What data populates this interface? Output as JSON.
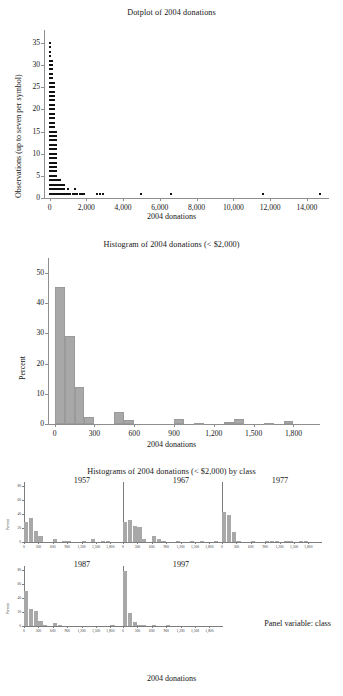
{
  "figure": {
    "caption_font": "serif",
    "background": "#ffffff",
    "bar_color": "#a8a8a8",
    "dot_color": "#111111",
    "axis_color": "#8e8e8e"
  },
  "chart_data": [
    {
      "id": "dotplot",
      "type": "scatter",
      "title": "Dotplot of 2004 donations",
      "xlabel": "2004 donations",
      "ylabel": "Observations (up to seven per symbol)",
      "xlim": [
        -300,
        15200
      ],
      "ylim": [
        0,
        37
      ],
      "xticks": [
        0,
        2000,
        4000,
        6000,
        8000,
        10000,
        12000,
        14000
      ],
      "xticklabels": [
        "0",
        "2,000",
        "4,000",
        "6,000",
        "8,000",
        "10,000",
        "12,000",
        "14,000"
      ],
      "yticks": [
        0,
        5,
        10,
        15,
        20,
        25,
        30,
        35
      ],
      "yticklabels": [
        "0",
        "5",
        "10",
        "15",
        "20",
        "25",
        "30",
        "35"
      ],
      "grid": false,
      "note": "Each column is a donation bin; stack height = number of observations (up to seven donors per plotted symbol).",
      "columns": [
        {
          "x": 40,
          "count": 35
        },
        {
          "x": 150,
          "count": 31
        },
        {
          "x": 260,
          "count": 26
        },
        {
          "x": 370,
          "count": 15
        },
        {
          "x": 480,
          "count": 4
        },
        {
          "x": 590,
          "count": 4
        },
        {
          "x": 700,
          "count": 3
        },
        {
          "x": 810,
          "count": 3
        },
        {
          "x": 920,
          "count": 1
        },
        {
          "x": 1030,
          "count": 2
        },
        {
          "x": 1140,
          "count": 1
        },
        {
          "x": 1250,
          "count": 1
        },
        {
          "x": 1400,
          "count": 2
        },
        {
          "x": 1520,
          "count": 1
        },
        {
          "x": 1640,
          "count": 1
        },
        {
          "x": 1760,
          "count": 1
        },
        {
          "x": 1880,
          "count": 1
        },
        {
          "x": 2600,
          "count": 1
        },
        {
          "x": 2750,
          "count": 1
        },
        {
          "x": 2900,
          "count": 1
        },
        {
          "x": 5000,
          "count": 1
        },
        {
          "x": 6600,
          "count": 1
        },
        {
          "x": 11600,
          "count": 1
        },
        {
          "x": 14700,
          "count": 1
        }
      ]
    },
    {
      "id": "histogram",
      "type": "bar",
      "title": "Histogram of 2004 donations (< $2,000)",
      "xlabel": "2004 donations",
      "ylabel": "Percent",
      "xlim": [
        -50,
        2000
      ],
      "ylim": [
        0,
        53
      ],
      "xticks": [
        0,
        300,
        600,
        900,
        1200,
        1500,
        1800
      ],
      "xticklabels": [
        "0",
        "300",
        "600",
        "900",
        "1,200",
        "1,500",
        "1,800"
      ],
      "yticks": [
        0,
        10,
        20,
        30,
        40,
        50
      ],
      "yticklabels": [
        "0",
        "10",
        "20",
        "30",
        "40",
        "50"
      ],
      "binwidth": 75,
      "grid": false,
      "bins": [
        {
          "left": 0,
          "value": 45.4
        },
        {
          "left": 75,
          "value": 29.0
        },
        {
          "left": 150,
          "value": 12.2
        },
        {
          "left": 225,
          "value": 2.3
        },
        {
          "left": 300,
          "value": 0.0
        },
        {
          "left": 375,
          "value": 0.0
        },
        {
          "left": 450,
          "value": 3.9
        },
        {
          "left": 525,
          "value": 1.2
        },
        {
          "left": 600,
          "value": 0.0
        },
        {
          "left": 675,
          "value": 0.0
        },
        {
          "left": 750,
          "value": 0.0
        },
        {
          "left": 825,
          "value": 0.0
        },
        {
          "left": 900,
          "value": 1.7
        },
        {
          "left": 975,
          "value": 0.0
        },
        {
          "left": 1050,
          "value": 0.4
        },
        {
          "left": 1125,
          "value": 0.0
        },
        {
          "left": 1200,
          "value": 0.0
        },
        {
          "left": 1275,
          "value": 0.7
        },
        {
          "left": 1350,
          "value": 1.8
        },
        {
          "left": 1425,
          "value": 0.0
        },
        {
          "left": 1500,
          "value": 0.0
        },
        {
          "left": 1575,
          "value": 0.4
        },
        {
          "left": 1650,
          "value": 0.0
        },
        {
          "left": 1725,
          "value": 1.1
        }
      ]
    },
    {
      "id": "panel",
      "type": "bar",
      "title": "Histograms of 2004 donations (< $2,000) by class",
      "xlabel": "2004 donations",
      "ylabel": "Percent",
      "panel_note": "Panel variable: class",
      "xlim": [
        0,
        2000
      ],
      "ylim": [
        0,
        80
      ],
      "xticks": [
        0,
        300,
        600,
        900,
        1200,
        1500,
        1800
      ],
      "xticklabels": [
        "0",
        "300",
        "600",
        "900",
        "1,200",
        "1,500",
        "1,800"
      ],
      "yticks": [
        0,
        20,
        40,
        60,
        80
      ],
      "yticklabels": [
        "0",
        "20",
        "40",
        "60",
        "80"
      ],
      "grid": false,
      "panels": [
        {
          "label": "1957",
          "bins": [
            {
              "left": 0,
              "value": 29
            },
            {
              "left": 100,
              "value": 34
            },
            {
              "left": 200,
              "value": 16
            },
            {
              "left": 300,
              "value": 8
            },
            {
              "left": 400,
              "value": 0
            },
            {
              "left": 500,
              "value": 0
            },
            {
              "left": 600,
              "value": 4
            },
            {
              "left": 700,
              "value": 0
            },
            {
              "left": 800,
              "value": 1
            },
            {
              "left": 900,
              "value": 1
            },
            {
              "left": 1000,
              "value": 0
            },
            {
              "left": 1100,
              "value": 0
            },
            {
              "left": 1200,
              "value": 1
            },
            {
              "left": 1300,
              "value": 0
            },
            {
              "left": 1400,
              "value": 4
            },
            {
              "left": 1500,
              "value": 0
            },
            {
              "left": 1600,
              "value": 1
            },
            {
              "left": 1700,
              "value": 1
            },
            {
              "left": 1800,
              "value": 0
            },
            {
              "left": 1900,
              "value": 0
            }
          ]
        },
        {
          "label": "1967",
          "bins": [
            {
              "left": 0,
              "value": 28
            },
            {
              "left": 100,
              "value": 32
            },
            {
              "left": 200,
              "value": 23
            },
            {
              "left": 300,
              "value": 22
            },
            {
              "left": 400,
              "value": 4
            },
            {
              "left": 500,
              "value": 0
            },
            {
              "left": 600,
              "value": 8
            },
            {
              "left": 700,
              "value": 4
            },
            {
              "left": 800,
              "value": 1
            },
            {
              "left": 900,
              "value": 0
            },
            {
              "left": 1000,
              "value": 0
            },
            {
              "left": 1100,
              "value": 1
            },
            {
              "left": 1200,
              "value": 0
            },
            {
              "left": 1300,
              "value": 0
            },
            {
              "left": 1400,
              "value": 1
            },
            {
              "left": 1500,
              "value": 0
            },
            {
              "left": 1600,
              "value": 1
            },
            {
              "left": 1700,
              "value": 0
            },
            {
              "left": 1800,
              "value": 0
            },
            {
              "left": 1900,
              "value": 1
            }
          ]
        },
        {
          "label": "1977",
          "bins": [
            {
              "left": 0,
              "value": 43
            },
            {
              "left": 100,
              "value": 38
            },
            {
              "left": 200,
              "value": 15
            },
            {
              "left": 300,
              "value": 2
            },
            {
              "left": 400,
              "value": 0
            },
            {
              "left": 500,
              "value": 0
            },
            {
              "left": 600,
              "value": 1
            },
            {
              "left": 700,
              "value": 0
            },
            {
              "left": 800,
              "value": 0
            },
            {
              "left": 900,
              "value": 1
            },
            {
              "left": 1000,
              "value": 1
            },
            {
              "left": 1100,
              "value": 1
            },
            {
              "left": 1200,
              "value": 0
            },
            {
              "left": 1300,
              "value": 1
            },
            {
              "left": 1400,
              "value": 1
            },
            {
              "left": 1500,
              "value": 0
            },
            {
              "left": 1600,
              "value": 1
            },
            {
              "left": 1700,
              "value": 1
            },
            {
              "left": 1800,
              "value": 0
            },
            {
              "left": 1900,
              "value": 0
            }
          ]
        },
        {
          "label": "1987",
          "bins": [
            {
              "left": 0,
              "value": 50
            },
            {
              "left": 100,
              "value": 24
            },
            {
              "left": 200,
              "value": 22
            },
            {
              "left": 300,
              "value": 7
            },
            {
              "left": 400,
              "value": 1
            },
            {
              "left": 500,
              "value": 0
            },
            {
              "left": 600,
              "value": 5
            },
            {
              "left": 700,
              "value": 1
            },
            {
              "left": 800,
              "value": 0
            },
            {
              "left": 900,
              "value": 0
            },
            {
              "left": 1000,
              "value": 0
            },
            {
              "left": 1100,
              "value": 0
            },
            {
              "left": 1200,
              "value": 0
            },
            {
              "left": 1300,
              "value": 0
            },
            {
              "left": 1400,
              "value": 0
            },
            {
              "left": 1500,
              "value": 0
            },
            {
              "left": 1600,
              "value": 0
            },
            {
              "left": 1700,
              "value": 0
            },
            {
              "left": 1800,
              "value": 1
            },
            {
              "left": 1900,
              "value": 0
            }
          ]
        },
        {
          "label": "1997",
          "bins": [
            {
              "left": 0,
              "value": 78
            },
            {
              "left": 100,
              "value": 19
            },
            {
              "left": 200,
              "value": 6
            },
            {
              "left": 300,
              "value": 1
            },
            {
              "left": 400,
              "value": 1
            },
            {
              "left": 500,
              "value": 0
            },
            {
              "left": 600,
              "value": 1
            },
            {
              "left": 700,
              "value": 0
            },
            {
              "left": 800,
              "value": 0
            },
            {
              "left": 900,
              "value": 1
            },
            {
              "left": 1000,
              "value": 0
            },
            {
              "left": 1100,
              "value": 0
            },
            {
              "left": 1200,
              "value": 0
            },
            {
              "left": 1300,
              "value": 0
            },
            {
              "left": 1400,
              "value": 0
            },
            {
              "left": 1500,
              "value": 0
            },
            {
              "left": 1600,
              "value": 0
            },
            {
              "left": 1700,
              "value": 0
            },
            {
              "left": 1800,
              "value": 0
            },
            {
              "left": 1900,
              "value": 0
            }
          ]
        }
      ]
    }
  ]
}
